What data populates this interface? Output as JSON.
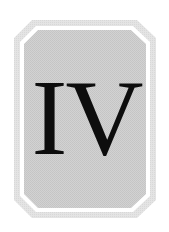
{
  "plaque": {
    "numeral": "IV",
    "colors": {
      "background": "#ffffff",
      "outer_frame": "#e0e0e0",
      "inner_line": "#ffffff",
      "panel": "#cdcdcd",
      "text": "#0d0d0d"
    }
  }
}
